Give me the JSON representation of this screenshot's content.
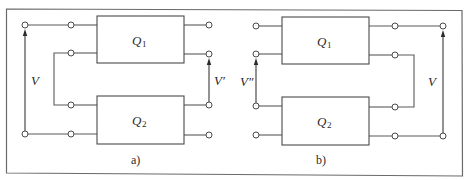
{
  "figure": {
    "panels": [
      {
        "id": "a",
        "caption": "a)",
        "blocks": [
          {
            "name": "Q",
            "sub": "1"
          },
          {
            "name": "Q",
            "sub": "2"
          }
        ],
        "voltages": [
          {
            "label": "V",
            "prime": ""
          },
          {
            "label": "V",
            "prime": "′"
          }
        ]
      },
      {
        "id": "b",
        "caption": "b)",
        "blocks": [
          {
            "name": "Q",
            "sub": "1"
          },
          {
            "name": "Q",
            "sub": "2"
          }
        ],
        "voltages": [
          {
            "label": "V",
            "prime": "″"
          },
          {
            "label": "V",
            "prime": ""
          }
        ]
      }
    ]
  }
}
